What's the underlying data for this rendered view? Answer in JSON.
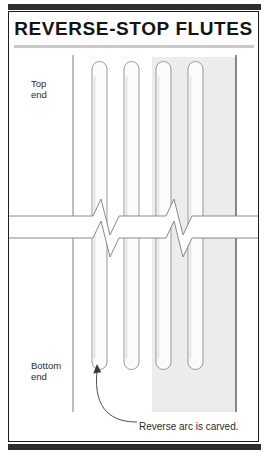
{
  "plate": {
    "title": "REVERSE-STOP FLUTES",
    "accent_color": "#2e2e2e",
    "frame_color": "#1d1d1d",
    "background_color": "#ffffff"
  },
  "labels": {
    "top_end_line1": "Top",
    "top_end_line2": "end",
    "bottom_end_line1": "Bottom",
    "bottom_end_line2": "end",
    "caption": "Reverse arc is carved."
  },
  "diagram": {
    "shaded_panel_color": "#ececec",
    "flute_fill_color": "#fbfbfb",
    "flute_outline_color": "#8d8d8d",
    "column_edge_color": "#6e6e6e",
    "break_symbol": "zigzag-break",
    "flute_count": 4,
    "flute_width": 15,
    "flute_pitch": 32,
    "flutes": [
      {
        "name": "flute-1",
        "x": 92,
        "shaded": false,
        "annotated": true
      },
      {
        "name": "flute-2",
        "x": 124,
        "shaded": false,
        "annotated": false
      },
      {
        "name": "flute-3",
        "x": 156,
        "shaded": true,
        "annotated": false
      },
      {
        "name": "flute-4",
        "x": 188,
        "shaded": true,
        "annotated": false
      }
    ]
  }
}
